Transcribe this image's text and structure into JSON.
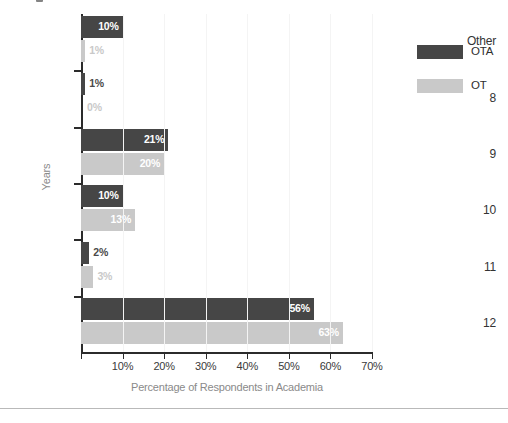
{
  "chart_data": {
    "type": "bar",
    "orientation": "horizontal",
    "title": "",
    "xlabel": "Percentage of Respondents in Academia",
    "ylabel": "Years",
    "categories": [
      "Other",
      "8",
      "9",
      "10",
      "11",
      "12"
    ],
    "series": [
      {
        "name": "OTA",
        "color": "#464646",
        "values": [
          10,
          1,
          21,
          10,
          2,
          56
        ],
        "labels": [
          "10%",
          "1%",
          "21%",
          "10%",
          "2%",
          "56%"
        ]
      },
      {
        "name": "OT",
        "color": "#c9c9c9",
        "values": [
          1,
          0,
          20,
          13,
          3,
          63
        ],
        "labels": [
          "1%",
          "0%",
          "20%",
          "13%",
          "3%",
          "63%"
        ]
      }
    ],
    "xlim": [
      0,
      70
    ],
    "xticks": [
      0,
      10,
      20,
      30,
      40,
      50,
      60,
      70
    ],
    "xtick_labels": [
      "",
      "10%",
      "20%",
      "30%",
      "40%",
      "50%",
      "60%",
      "70%"
    ],
    "grid": true,
    "legend_position": "right"
  },
  "legend": {
    "entries": [
      {
        "label": "OTA",
        "color": "#464646"
      },
      {
        "label": "OT",
        "color": "#c9c9c9"
      }
    ]
  },
  "axes": {
    "x_title": "Percentage of Respondents in Academia",
    "y_title": "Years"
  },
  "colors": {
    "ota": "#464646",
    "ot": "#c9c9c9",
    "axis": "#2b2b2b",
    "grid": "#f4f4f4",
    "axis_title": "#8a8a8a"
  }
}
